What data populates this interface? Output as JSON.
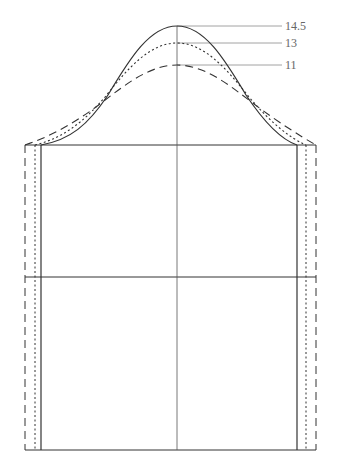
{
  "diagram": {
    "title": "",
    "type": "sleeve-cap-pattern",
    "labels": [
      {
        "id": "cap_solid",
        "text": "14.5",
        "line_style": "solid"
      },
      {
        "id": "cap_dotted",
        "text": "13",
        "line_style": "dotted"
      },
      {
        "id": "cap_dashed",
        "text": "11",
        "line_style": "dashed"
      }
    ],
    "colors": {
      "line": "#333333",
      "guide": "#888888",
      "label": "#666666"
    }
  }
}
